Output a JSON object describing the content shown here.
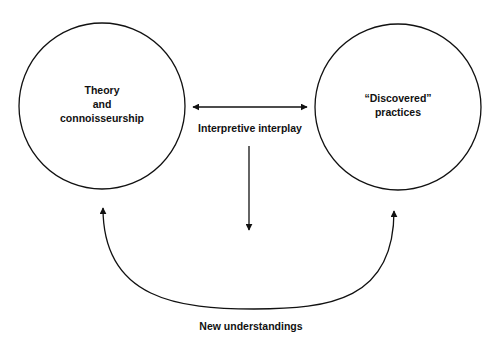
{
  "diagram": {
    "nodes": [
      {
        "id": "theory",
        "lines": [
          "Theory",
          "and",
          "connoisseurship"
        ]
      },
      {
        "id": "practices",
        "lines": [
          "“Discovered”",
          "practices"
        ]
      }
    ],
    "edges": {
      "interplay": {
        "label": "Interpretive interplay",
        "type": "bidirectional"
      },
      "outcome": {
        "label": "New understandings",
        "type": "curved-bidirectional"
      }
    }
  },
  "colors": {
    "stroke": "#111111",
    "background": "#ffffff"
  }
}
